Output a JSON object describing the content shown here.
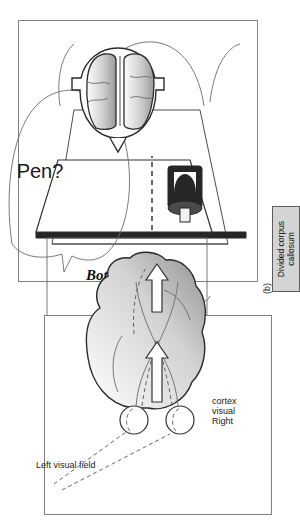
{
  "figure": {
    "orientation": "rotated-90-ccw",
    "background": "#ffffff",
    "line_color": "#4d4d4d"
  },
  "panel_b": {
    "letter": "(b)",
    "speech_bubble_text": "Pen?",
    "written_word": "Bottle",
    "caption_box": {
      "line1": "Divided corpus",
      "line2": "callosum",
      "fill": "#d4d4d4",
      "border": "#5c5c5c"
    },
    "elements": {
      "barrier": "vertical-screen-divider",
      "left_hand_drawing": "hand-holding-pen",
      "object_behind_screen": "bottle",
      "head_view": "axial-brain-with-split-corpus-callosum"
    }
  },
  "panel_c": {
    "label_left_visual_field": "Left visual field",
    "label_right_visual_cortex_line1": "Right",
    "label_right_visual_cortex_line2": "visual",
    "label_right_visual_cortex_line3": "cortex",
    "elements": {
      "eyes": "two-eyeballs",
      "brain": "sagittal-brain-shaded",
      "pathways": "optic-nerve-crossing-chiasm",
      "arrows": "white-block-arrows-to-cortex"
    }
  },
  "colors": {
    "panel_border": "#7f7f7f",
    "ink": "#1a1a1a",
    "brain_shade_light": "#fdfdfd",
    "brain_shade_dark": "#9a9a9a",
    "bottle": "#262626"
  }
}
